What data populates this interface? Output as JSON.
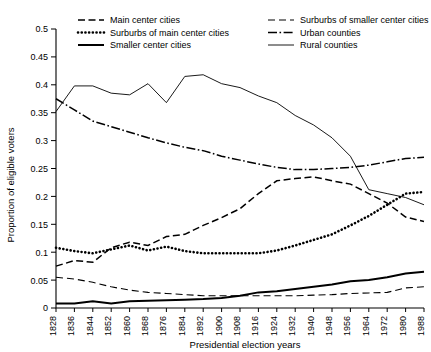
{
  "chart_data": {
    "type": "line",
    "title": "",
    "xlabel": "Presidential election years",
    "ylabel": "Proportion of eligible voters",
    "ylim": [
      0,
      0.5
    ],
    "grid": false,
    "legend_position": "top",
    "ytick_labels": [
      "0",
      "0.05",
      "0.1",
      "0.15",
      "0.2",
      "0.25",
      "0.3",
      "0.35",
      "0.4",
      "0.45",
      "0.5"
    ],
    "ytick_values": [
      0,
      0.05,
      0.1,
      0.15,
      0.2,
      0.25,
      0.3,
      0.35,
      0.4,
      0.45,
      0.5
    ],
    "categories": [
      "1828",
      "1836",
      "1844",
      "1852",
      "1860",
      "1868",
      "1876",
      "1884",
      "1892",
      "1900",
      "1908",
      "1916",
      "1924",
      "1932",
      "1940",
      "1948",
      "1956",
      "1964",
      "1972",
      "1980",
      "1988"
    ],
    "x": [
      1828,
      1836,
      1844,
      1852,
      1860,
      1868,
      1876,
      1884,
      1892,
      1900,
      1908,
      1916,
      1924,
      1932,
      1940,
      1948,
      1956,
      1964,
      1972,
      1980,
      1988
    ],
    "series": [
      {
        "name": "Main center cities",
        "style": "dashed",
        "values": [
          0.075,
          0.085,
          0.082,
          0.108,
          0.118,
          0.112,
          0.128,
          0.132,
          0.148,
          0.162,
          0.178,
          0.205,
          0.228,
          0.232,
          0.235,
          0.228,
          0.222,
          0.205,
          0.188,
          0.163,
          0.155
        ]
      },
      {
        "name": "Surburbs of main center cities",
        "style": "dotted",
        "values": [
          0.108,
          0.102,
          0.098,
          0.105,
          0.112,
          0.103,
          0.11,
          0.102,
          0.098,
          0.098,
          0.098,
          0.098,
          0.103,
          0.112,
          0.122,
          0.132,
          0.148,
          0.165,
          0.185,
          0.205,
          0.208
        ]
      },
      {
        "name": "Smaller center cities",
        "style": "solid-thick",
        "values": [
          0.008,
          0.008,
          0.012,
          0.008,
          0.012,
          0.013,
          0.014,
          0.015,
          0.016,
          0.018,
          0.022,
          0.028,
          0.03,
          0.034,
          0.038,
          0.042,
          0.048,
          0.05,
          0.055,
          0.062,
          0.065
        ]
      },
      {
        "name": "Surburbs of smaller center cities",
        "style": "dashed-long",
        "values": [
          0.055,
          0.052,
          0.046,
          0.038,
          0.032,
          0.028,
          0.026,
          0.024,
          0.022,
          0.022,
          0.022,
          0.022,
          0.022,
          0.022,
          0.023,
          0.024,
          0.026,
          0.027,
          0.028,
          0.036,
          0.038
        ]
      },
      {
        "name": "Urban counties",
        "style": "dash-dot",
        "values": [
          0.375,
          0.355,
          0.335,
          0.325,
          0.315,
          0.305,
          0.296,
          0.288,
          0.282,
          0.272,
          0.265,
          0.258,
          0.252,
          0.248,
          0.248,
          0.25,
          0.252,
          0.256,
          0.262,
          0.268,
          0.27
        ]
      },
      {
        "name": "Rural counties",
        "style": "solid-thin",
        "values": [
          0.352,
          0.398,
          0.398,
          0.385,
          0.382,
          0.402,
          0.368,
          0.415,
          0.418,
          0.402,
          0.395,
          0.38,
          0.368,
          0.345,
          0.328,
          0.305,
          0.272,
          0.212,
          0.205,
          0.198,
          0.185
        ]
      }
    ]
  },
  "legend": {
    "entries": [
      {
        "label": "Main center cities",
        "style": "dashed"
      },
      {
        "label": "Surburbs of smaller center cities",
        "style": "dashed-long"
      },
      {
        "label": "Surburbs of main center cities",
        "style": "dotted"
      },
      {
        "label": "Urban counties",
        "style": "dash-dot"
      },
      {
        "label": "Smaller center cities",
        "style": "solid-thick"
      },
      {
        "label": "Rural counties",
        "style": "solid-thin"
      }
    ]
  }
}
